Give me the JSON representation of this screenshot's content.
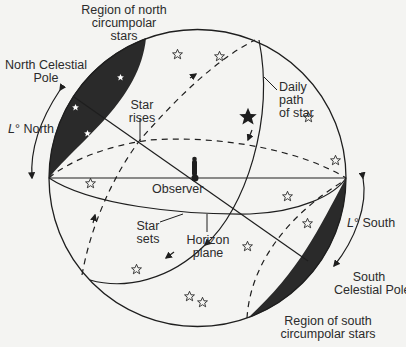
{
  "diagram": {
    "labels": {
      "north_region": [
        "Region of north",
        "circumpolar",
        "stars"
      ],
      "north_pole": [
        "North Celestial",
        "Pole"
      ],
      "lat_north_symbol": "L",
      "lat_north_text": "° North",
      "star_rises": [
        "Star",
        "rises"
      ],
      "daily_path": [
        "Daily",
        "path",
        "of star"
      ],
      "observer": "Observer",
      "star_sets": [
        "Star",
        "sets"
      ],
      "horizon_plane": [
        "Horizon",
        "plane"
      ],
      "lat_south_symbol": "L",
      "lat_south_text": "° South",
      "south_pole": [
        "South",
        "Celestial Pole"
      ],
      "south_region": [
        "Region of south",
        "circumpolar stars"
      ]
    },
    "colors": {
      "line": "#1e1e1e",
      "dark_region": "#2a2a2a",
      "background": "#f4f4f2"
    }
  }
}
